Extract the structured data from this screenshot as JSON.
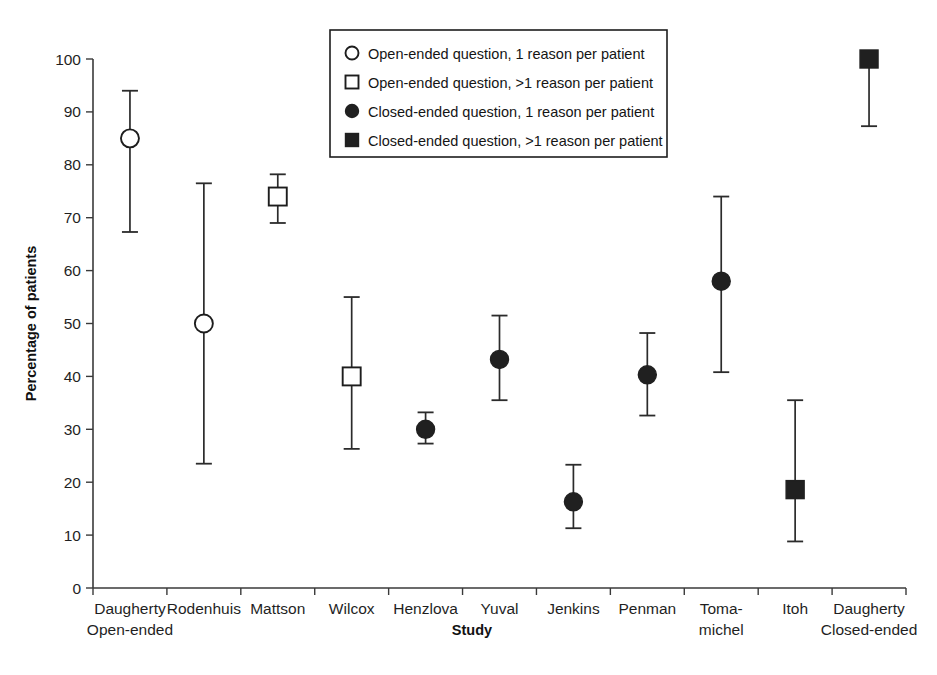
{
  "chart_data": {
    "type": "scatter",
    "title": "",
    "xlabel": "Study",
    "ylabel": "Percentage of patients",
    "ylim": [
      0,
      100
    ],
    "ytick_step": 10,
    "yticks": [
      0,
      10,
      20,
      30,
      40,
      50,
      60,
      70,
      80,
      90,
      100
    ],
    "grid": false,
    "legend_position": "top-center",
    "error_bars": "vertical, capped (95% confidence interval)",
    "categories": [
      "Daugherty Open-ended",
      "Rodenhuis",
      "Mattson",
      "Wilcox",
      "Henzlova",
      "Yuval",
      "Jenkins",
      "Penman",
      "Toma-michel",
      "Itoh",
      "Daugherty Closed-ended"
    ],
    "category_labels": [
      {
        "line1": "Daugherty",
        "line2": "Open-ended"
      },
      {
        "line1": "Rodenhuis",
        "line2": ""
      },
      {
        "line1": "Mattson",
        "line2": ""
      },
      {
        "line1": "Wilcox",
        "line2": ""
      },
      {
        "line1": "Henzlova",
        "line2": ""
      },
      {
        "line1": "Yuval",
        "line2": ""
      },
      {
        "line1": "Jenkins",
        "line2": ""
      },
      {
        "line1": "Penman",
        "line2": ""
      },
      {
        "line1": "Toma-",
        "line2": "michel"
      },
      {
        "line1": "Itoh",
        "line2": ""
      },
      {
        "line1": "Daugherty",
        "line2": "Closed-ended"
      }
    ],
    "points": [
      {
        "study": "Daugherty Open-ended",
        "value": 85.0,
        "low": 67.3,
        "high": 94.0,
        "marker": "open-circle"
      },
      {
        "study": "Rodenhuis",
        "value": 50.0,
        "low": 23.5,
        "high": 76.5,
        "marker": "open-circle"
      },
      {
        "study": "Mattson",
        "value": 74.0,
        "low": 69.0,
        "high": 78.2,
        "marker": "open-square"
      },
      {
        "study": "Wilcox",
        "value": 40.0,
        "low": 26.3,
        "high": 55.0,
        "marker": "open-square"
      },
      {
        "study": "Henzlova",
        "value": 30.0,
        "low": 27.3,
        "high": 33.2,
        "marker": "closed-circle"
      },
      {
        "study": "Yuval",
        "value": 43.2,
        "low": 35.5,
        "high": 51.5,
        "marker": "closed-circle"
      },
      {
        "study": "Jenkins",
        "value": 16.3,
        "low": 11.3,
        "high": 23.3,
        "marker": "closed-circle"
      },
      {
        "study": "Penman",
        "value": 40.3,
        "low": 32.6,
        "high": 48.2,
        "marker": "closed-circle"
      },
      {
        "study": "Toma-michel",
        "value": 58.0,
        "low": 40.8,
        "high": 74.0,
        "marker": "closed-circle"
      },
      {
        "study": "Itoh",
        "value": 18.6,
        "low": 8.8,
        "high": 35.5,
        "marker": "closed-square"
      },
      {
        "study": "Daugherty Closed-ended",
        "value": 100.0,
        "low": 87.3,
        "high": 100.0,
        "marker": "closed-square"
      }
    ],
    "legend": [
      {
        "marker": "open-circle",
        "label": "Open-ended question, 1 reason per patient"
      },
      {
        "marker": "open-square",
        "label": "Open-ended question, >1 reason per patient"
      },
      {
        "marker": "closed-circle",
        "label": "Closed-ended question, 1 reason per patient"
      },
      {
        "marker": "closed-square",
        "label": "Closed-ended question, >1 reason per patient"
      }
    ],
    "colors": {
      "axis": "#3a3a3a",
      "marker_fill_open": "#ffffff",
      "marker_fill_closed": "#202020",
      "marker_stroke": "#1d1d1d",
      "error_bar": "#2b2b2b",
      "background": "#ffffff",
      "text": "#1a1a1a"
    }
  }
}
